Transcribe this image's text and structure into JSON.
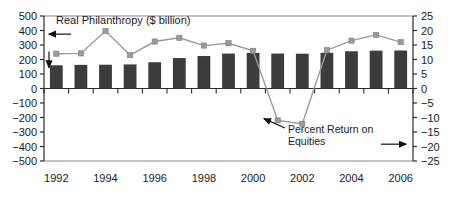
{
  "chart_data": {
    "type": "bar",
    "title": "",
    "categories": [
      1992,
      1993,
      1994,
      1995,
      1996,
      1997,
      1998,
      1999,
      2000,
      2001,
      2002,
      2003,
      2004,
      2005,
      2006
    ],
    "xlabel": "",
    "x_tick_labels": [
      "1992",
      "1994",
      "1996",
      "1998",
      "2000",
      "2002",
      "2004",
      "2006"
    ],
    "x_tick_values": [
      1992,
      1994,
      1996,
      1998,
      2000,
      2002,
      2004,
      2006
    ],
    "grid": false,
    "legend_position": "inline-annotations",
    "series": [
      {
        "name": "Real Philanthropy ($ billion)",
        "type": "bar",
        "axis": "left",
        "color": "#3c3c3c",
        "values": [
          160,
          163,
          164,
          166,
          181,
          210,
          224,
          241,
          246,
          241,
          240,
          246,
          257,
          261,
          262
        ]
      },
      {
        "name": "Percent Return on Equities",
        "type": "line",
        "axis": "right",
        "color": "#9a9a9a",
        "marker": "square",
        "values": [
          12.0,
          12.1,
          19.8,
          11.5,
          16.2,
          17.5,
          14.8,
          15.6,
          13.0,
          -11.0,
          -12.2,
          13.2,
          16.5,
          18.5,
          16.0
        ]
      }
    ],
    "left_axis": {
      "label": "",
      "ylim": [
        -500,
        500
      ],
      "ticks": [
        500,
        400,
        300,
        200,
        100,
        0,
        -100,
        -200,
        -300,
        -400,
        -500
      ],
      "tick_labels": [
        "500",
        "400",
        "300",
        "200",
        "100",
        "0",
        "−100",
        "−200",
        "−300",
        "−400",
        "−500"
      ]
    },
    "right_axis": {
      "label": "",
      "ylim": [
        -25,
        25
      ],
      "ticks": [
        25,
        20,
        15,
        10,
        5,
        0,
        -5,
        -10,
        -15,
        -20,
        -25
      ],
      "tick_labels": [
        "25",
        "20",
        "15",
        "10",
        "5",
        "0",
        "−5",
        "−10",
        "−15",
        "−20",
        "−25"
      ]
    },
    "annotations": [
      {
        "name": "left-series-label",
        "text": "Real Philanthropy ($ billion)",
        "points_to": "left-axis"
      },
      {
        "name": "right-series-label-line1",
        "text": "Percent Return on",
        "points_to": "right-axis"
      },
      {
        "name": "right-series-label-line2",
        "text": "Equities",
        "points_to": "right-axis"
      }
    ]
  }
}
